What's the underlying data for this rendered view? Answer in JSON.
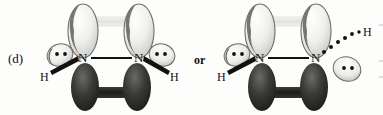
{
  "figure": {
    "part_label": "(d)",
    "conjunction": "or",
    "background_color": "#fdfdfc",
    "ink_color": "#111111",
    "lobe_light_color": "#e8e8e6",
    "lobe_dark_color": "#2a2a28"
  },
  "structures": [
    {
      "id": "structure-left",
      "description": "diimide cis isomer orbital diagram",
      "atoms": [
        {
          "id": "n-left",
          "symbol": "N",
          "x": 83,
          "y": 58
        },
        {
          "id": "n-right",
          "symbol": "N",
          "x": 139,
          "y": 58
        },
        {
          "id": "h-left",
          "symbol": "H",
          "x": 44,
          "y": 77
        },
        {
          "id": "h-right",
          "symbol": "H",
          "x": 174,
          "y": 77
        }
      ],
      "lone_pairs": [
        {
          "id": "lp-left",
          "dots": 2,
          "x": 61,
          "y": 54
        },
        {
          "id": "lp-right",
          "dots": 2,
          "x": 161,
          "y": 54
        }
      ],
      "bonds": [
        {
          "id": "n-n-sigma",
          "type": "line",
          "from": "n-left",
          "to": "n-right"
        },
        {
          "id": "n-h-left",
          "type": "wedge",
          "from": "n-left",
          "to": "h-left"
        },
        {
          "id": "n-h-right",
          "type": "wedge",
          "from": "n-right",
          "to": "h-right"
        },
        {
          "id": "pi-top",
          "type": "lobe-overlap-light"
        },
        {
          "id": "pi-bottom",
          "type": "lobe-overlap-dark"
        }
      ]
    },
    {
      "id": "structure-right",
      "description": "diimide trans isomer orbital diagram",
      "atoms": [
        {
          "id": "n-left",
          "symbol": "N",
          "x": 260,
          "y": 58
        },
        {
          "id": "n-right",
          "symbol": "N",
          "x": 316,
          "y": 58
        },
        {
          "id": "h-left",
          "symbol": "H",
          "x": 221,
          "y": 77
        },
        {
          "id": "h-right",
          "symbol": "H",
          "x": 367,
          "y": 32
        }
      ],
      "lone_pairs": [
        {
          "id": "lp-left",
          "dots": 2,
          "x": 238,
          "y": 54
        },
        {
          "id": "lp-right",
          "dots": 2,
          "x": 348,
          "y": 68
        }
      ],
      "bonds": [
        {
          "id": "n-n-sigma",
          "type": "line",
          "from": "n-left",
          "to": "n-right"
        },
        {
          "id": "n-h-left",
          "type": "wedge",
          "from": "n-left",
          "to": "h-left"
        },
        {
          "id": "n-h-right",
          "type": "dashed",
          "from": "n-right",
          "to": "h-right"
        },
        {
          "id": "pi-top",
          "type": "lobe-overlap-light"
        },
        {
          "id": "pi-bottom",
          "type": "lobe-overlap-dark"
        }
      ]
    }
  ]
}
